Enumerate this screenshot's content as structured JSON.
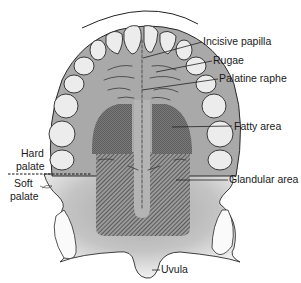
{
  "figure": {
    "labels": {
      "incisive_papilla": "Incisive papilla",
      "rugae": "Rugae",
      "palatine_raphe": "Palatine raphe",
      "fatty_area": "Fatty area",
      "hard_palate_line1": "Hard",
      "hard_palate_line2": "palate",
      "soft_palate_line1": "Soft",
      "soft_palate_line2": "palate",
      "glandular_area": "Glandular area",
      "uvula": "Uvula"
    },
    "colors": {
      "palate_gray": "#a9a9a9",
      "fatty_dark": "#6e6e6e",
      "glandular_hatch": "#5a5a5a",
      "tooth_fill": "#ececec",
      "outline": "#2a2a2a"
    }
  }
}
